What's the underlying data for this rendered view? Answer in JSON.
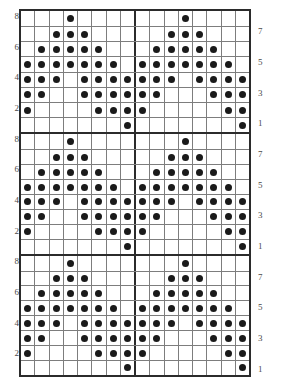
{
  "chart_data": {
    "type": "heatmap",
    "title": "",
    "subtitle": "",
    "xlabel": "",
    "ylabel": "",
    "grid": true,
    "legend_position": "none",
    "columns": 16,
    "rows_per_block": 8,
    "blocks": 3,
    "repeat_width": 8,
    "divider_after_column": 8,
    "filled_symbol": "filled-circle",
    "empty_symbol": "blank",
    "colors": {
      "dot": "#1a1a1a",
      "thick_line": "#2b2b2b",
      "thin_line": "#7d7d7d",
      "background": "#ffffff",
      "label": "#4a4a4a"
    },
    "x": [
      1,
      2,
      3,
      4,
      5,
      6,
      7,
      8,
      9,
      10,
      11,
      12,
      13,
      14,
      15,
      16
    ],
    "row_labels_left": [
      "8",
      "",
      "6",
      "",
      "4",
      "",
      "2",
      ""
    ],
    "row_labels_right": [
      "",
      "7",
      "",
      "5",
      "",
      "3",
      "",
      "1"
    ],
    "row_order_top_to_bottom": [
      8,
      7,
      6,
      5,
      4,
      3,
      2,
      1
    ],
    "rows": [
      {
        "row": 8,
        "filled_columns": [
          4,
          12
        ]
      },
      {
        "row": 7,
        "filled_columns": [
          3,
          4,
          5,
          11,
          12,
          13
        ]
      },
      {
        "row": 6,
        "filled_columns": [
          2,
          3,
          4,
          5,
          6,
          10,
          11,
          12,
          13,
          14
        ]
      },
      {
        "row": 5,
        "filled_columns": [
          1,
          2,
          3,
          4,
          5,
          6,
          7,
          9,
          10,
          11,
          12,
          13,
          14,
          15
        ]
      },
      {
        "row": 4,
        "filled_columns": [
          1,
          2,
          3,
          5,
          6,
          7,
          8,
          9,
          10,
          11,
          13,
          14,
          15,
          16
        ]
      },
      {
        "row": 3,
        "filled_columns": [
          1,
          2,
          5,
          6,
          7,
          8,
          9,
          10,
          14,
          15,
          16
        ]
      },
      {
        "row": 2,
        "filled_columns": [
          1,
          6,
          7,
          8,
          9,
          15,
          16
        ]
      },
      {
        "row": 1,
        "filled_columns": [
          8,
          16
        ]
      }
    ],
    "matrix_top_to_bottom": [
      [
        0,
        0,
        0,
        1,
        0,
        0,
        0,
        0,
        0,
        0,
        0,
        1,
        0,
        0,
        0,
        0
      ],
      [
        0,
        0,
        1,
        1,
        1,
        0,
        0,
        0,
        0,
        0,
        1,
        1,
        1,
        0,
        0,
        0
      ],
      [
        0,
        1,
        1,
        1,
        1,
        1,
        0,
        0,
        0,
        1,
        1,
        1,
        1,
        1,
        0,
        0
      ],
      [
        1,
        1,
        1,
        1,
        1,
        1,
        1,
        0,
        1,
        1,
        1,
        1,
        1,
        1,
        1,
        0
      ],
      [
        1,
        1,
        1,
        0,
        1,
        1,
        1,
        1,
        1,
        1,
        1,
        0,
        1,
        1,
        1,
        1
      ],
      [
        1,
        1,
        0,
        0,
        1,
        1,
        1,
        1,
        1,
        1,
        0,
        0,
        0,
        1,
        1,
        1
      ],
      [
        1,
        0,
        0,
        0,
        0,
        1,
        1,
        1,
        1,
        0,
        0,
        0,
        0,
        0,
        1,
        1
      ],
      [
        0,
        0,
        0,
        0,
        0,
        0,
        0,
        1,
        0,
        0,
        0,
        0,
        0,
        0,
        0,
        1
      ]
    ],
    "counts_per_row": {
      "8": 2,
      "7": 6,
      "6": 10,
      "5": 14,
      "4": 14,
      "3": 11,
      "2": 7,
      "1": 2
    },
    "total_filled_per_block": 66,
    "total_filled_all_blocks": 198
  },
  "labels": {
    "left": [
      "8",
      "",
      "6",
      "",
      "4",
      "",
      "2",
      ""
    ],
    "right": [
      "",
      "7",
      "",
      "5",
      "",
      "3",
      "",
      "1"
    ]
  }
}
